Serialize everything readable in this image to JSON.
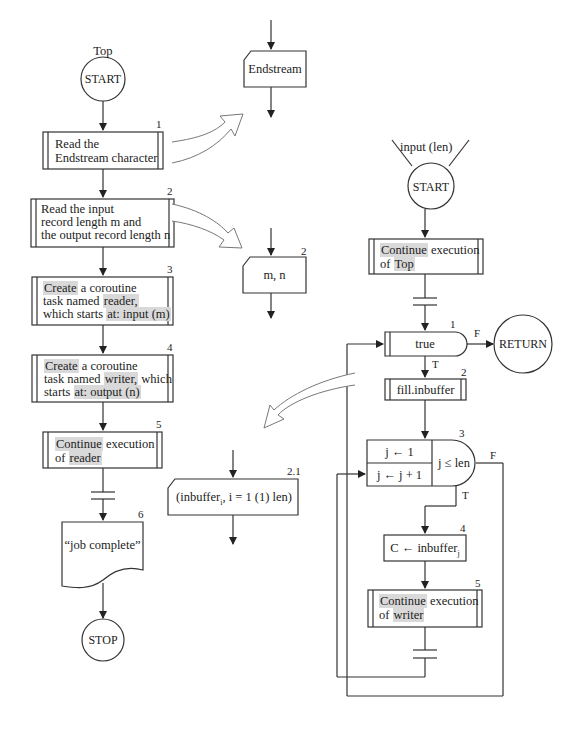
{
  "left_flow": {
    "title": "Top",
    "start": "START",
    "steps": [
      {
        "num": "1",
        "lines": [
          "Read the",
          "Endstream character"
        ]
      },
      {
        "num": "2",
        "lines": [
          "Read the input",
          "record length m and",
          "the output record length n"
        ]
      },
      {
        "num": "3",
        "parts": {
          "create": "Create",
          "a": " a coroutine",
          "task": "task named ",
          "name": "reader,",
          "which": "which starts ",
          "at": "at:  input (m)"
        }
      },
      {
        "num": "4",
        "parts": {
          "create": "Create",
          "a": " a coroutine",
          "task": "task named ",
          "name": "writer,",
          "which_tail": " which",
          "starts": "starts ",
          "at": "at:  output (n)"
        }
      },
      {
        "num": "5",
        "parts": {
          "cont": "Continue",
          "exec": " execution",
          "of": "of ",
          "name": "reader"
        }
      },
      {
        "num": "6",
        "text": "“job complete”"
      }
    ],
    "stop": "STOP"
  },
  "io_blocks": {
    "endstream": "Endstream",
    "mn": {
      "num": "2",
      "text": "m, n"
    },
    "inbuffer": {
      "num": "2.1",
      "pre": "(inbuffer",
      "sub": "i",
      "post": ", i = 1 (1) len)"
    }
  },
  "right_flow": {
    "entry": "input (len)",
    "start": "START",
    "continue_top": {
      "cont": "Continue",
      "exec": " execution",
      "of": "of ",
      "name": "Top"
    },
    "decision1": {
      "num": "1",
      "text": "true",
      "true_label": "T",
      "false_label": "F"
    },
    "return": "RETURN",
    "fill": {
      "num": "2",
      "text": "fill.inbuffer"
    },
    "loop": {
      "num": "3",
      "init": "j ← 1",
      "incr": "j ← j + 1",
      "cond": "j ≤ len",
      "true_label": "T",
      "false_label": "F"
    },
    "assign": {
      "num": "4",
      "pre": "C ← inbuffer",
      "sub": "j"
    },
    "continue_writer": {
      "num": "5",
      "cont": "Continue",
      "exec": " execution",
      "of": "of ",
      "name": "writer"
    }
  }
}
